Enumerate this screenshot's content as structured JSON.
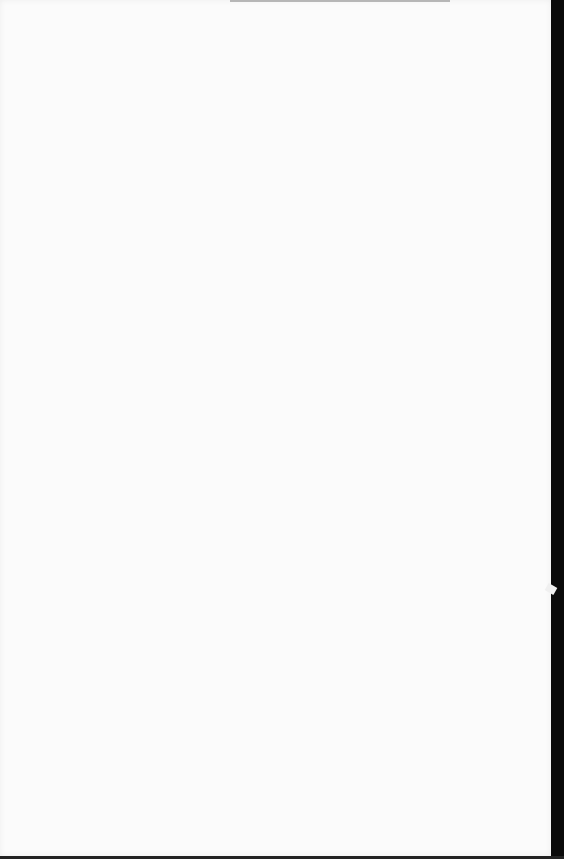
{
  "document": {
    "type": "scanned-page",
    "content": "",
    "colors": {
      "page": "#fbfbfb",
      "edge": "#0a0a0a"
    }
  }
}
